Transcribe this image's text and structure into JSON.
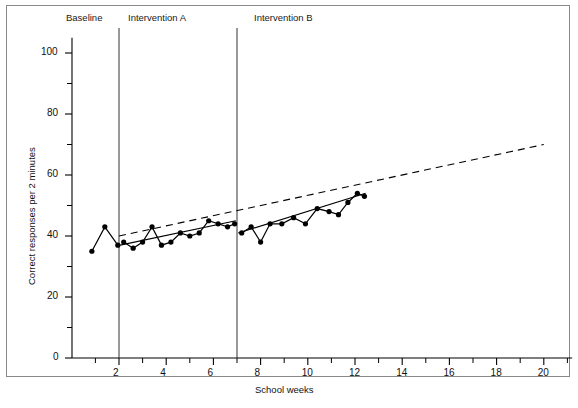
{
  "figure": {
    "background": "#ffffff",
    "border_color": "#8a8a8a",
    "line_color": "#000000",
    "marker_color": "#000000"
  },
  "axes": {
    "x_title": "School weeks",
    "y_title": "Correct responses per 2 minutes"
  },
  "phases": [
    {
      "label": "Baseline",
      "start_week": 0.6,
      "end_week": 2
    },
    {
      "label": "Intervention A",
      "start_week": 2,
      "end_week": 7
    },
    {
      "label": "Intervention B",
      "start_week": 7,
      "end_week": 21
    }
  ],
  "ticks": {
    "x_major": [
      "2",
      "4",
      "6",
      "8",
      "10",
      "12",
      "14",
      "16",
      "18",
      "20"
    ],
    "y_major": [
      "0",
      "20",
      "40",
      "60",
      "80",
      "100"
    ]
  },
  "chart_data": {
    "type": "line",
    "title": "",
    "subtitle": "",
    "xlabel": "School weeks",
    "ylabel": "Correct responses per 2 minutes",
    "xlim": [
      0.5,
      21
    ],
    "ylim": [
      0,
      105
    ],
    "x_major_ticks": [
      2,
      4,
      6,
      8,
      10,
      12,
      14,
      16,
      18,
      20
    ],
    "x_minor_ticks": [
      1,
      3,
      5,
      7,
      9,
      11,
      13,
      15,
      17,
      19,
      21
    ],
    "y_major_ticks": [
      0,
      20,
      40,
      60,
      80,
      100
    ],
    "y_minor_ticks": [
      10,
      30,
      50,
      70,
      90
    ],
    "grid": false,
    "legend": "none",
    "phase_lines": [
      2,
      7
    ],
    "phase_labels": [
      "Baseline",
      "Intervention A",
      "Intervention B"
    ],
    "series": [
      {
        "name": "Baseline",
        "style": "solid-with-markers",
        "x": [
          0.85,
          1.4,
          1.95
        ],
        "values": [
          35,
          43,
          37
        ]
      },
      {
        "name": "Intervention A",
        "style": "solid-with-markers",
        "x": [
          2.2,
          2.6,
          3.0,
          3.4,
          3.8,
          4.2,
          4.6,
          5.0,
          5.4,
          5.8,
          6.2,
          6.6,
          6.9
        ],
        "values": [
          38,
          36,
          38,
          43,
          37,
          38,
          41,
          40,
          41,
          45,
          44,
          43,
          44
        ]
      },
      {
        "name": "Intervention B",
        "style": "solid-with-markers",
        "x": [
          7.2,
          7.6,
          8.0,
          8.4,
          8.9,
          9.4,
          9.9,
          10.4,
          10.9,
          11.3,
          11.7,
          12.1,
          12.4
        ],
        "values": [
          41,
          43,
          38,
          44,
          44,
          46,
          44,
          49,
          48,
          47,
          51,
          54,
          53
        ]
      },
      {
        "name": "Intervention A trend",
        "style": "solid",
        "x": [
          2.05,
          6.95
        ],
        "values": [
          37,
          45
        ]
      },
      {
        "name": "Intervention B trend",
        "style": "solid",
        "x": [
          7.05,
          12.45
        ],
        "values": [
          41,
          54
        ]
      },
      {
        "name": "Aim line",
        "style": "dashed",
        "x": [
          2.0,
          20.0
        ],
        "values": [
          40,
          70
        ]
      }
    ]
  }
}
